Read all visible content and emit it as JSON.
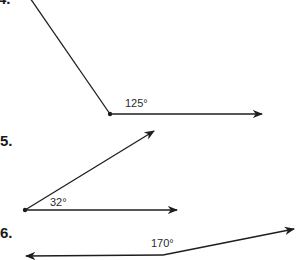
{
  "problems": [
    {
      "number": "4.",
      "angle_label": "125°",
      "angle_degrees": 125
    },
    {
      "number": "5.",
      "angle_label": "32°",
      "angle_degrees": 32
    },
    {
      "number": "6.",
      "angle_label": "170°",
      "angle_degrees": 170
    }
  ],
  "colors": {
    "line": "#1e1e1e",
    "text": "#1a1a1a"
  }
}
